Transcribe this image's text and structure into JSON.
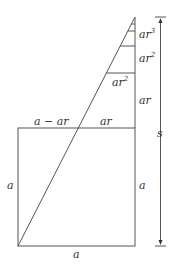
{
  "diagram": {
    "labels": {
      "ar3": "ar",
      "ar3_exp": "3",
      "ar2_right": "ar",
      "ar2_right_exp": "2",
      "ar2_inner": "ar",
      "ar2_inner_exp": "2",
      "ar_right": "ar",
      "ar_top": "ar",
      "a_minus_ar": "a − ar",
      "s": "s",
      "a_left": "a",
      "a_right": "a",
      "a_bottom": "a"
    },
    "colors": {
      "line": "#555555",
      "text": "#333333"
    }
  }
}
